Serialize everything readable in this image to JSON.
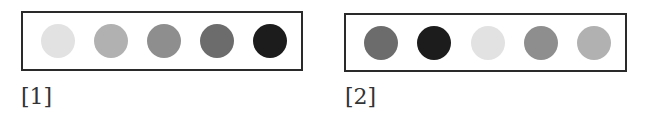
{
  "panels": [
    {
      "label": "[1]",
      "dots": [
        {
          "shade": "very-light",
          "color": "#e2e2e2"
        },
        {
          "shade": "light",
          "color": "#b1b1b1"
        },
        {
          "shade": "medium",
          "color": "#8e8e8e"
        },
        {
          "shade": "dark-medium",
          "color": "#6c6c6c"
        },
        {
          "shade": "near-black",
          "color": "#1c1c1c"
        }
      ]
    },
    {
      "label": "[2]",
      "dots": [
        {
          "shade": "dark-medium",
          "color": "#6c6c6c"
        },
        {
          "shade": "near-black",
          "color": "#1c1c1c"
        },
        {
          "shade": "very-light",
          "color": "#e2e2e2"
        },
        {
          "shade": "medium",
          "color": "#8e8e8e"
        },
        {
          "shade": "light",
          "color": "#b1b1b1"
        }
      ]
    }
  ]
}
